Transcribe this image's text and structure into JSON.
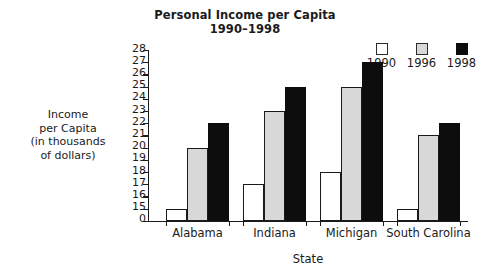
{
  "chart_data": {
    "type": "bar",
    "title": "Personal Income per Capita",
    "subtitle": "1990–1998",
    "xlabel": "State",
    "ylabel_lines": [
      "Income",
      "per Capita",
      "(in thousands",
      "of dollars)"
    ],
    "ylabel": "Income per Capita (in thousands of dollars)",
    "categories": [
      "Alabama",
      "Indiana",
      "Michigan",
      "South Carolina"
    ],
    "series": [
      {
        "name": "1990",
        "color": "#ffffff",
        "values": [
          15,
          17,
          18,
          15
        ]
      },
      {
        "name": "1996",
        "color": "#d8d8d8",
        "values": [
          20,
          23,
          25,
          21
        ]
      },
      {
        "name": "1998",
        "color": "#0d0d0d",
        "values": [
          22,
          25,
          27,
          22
        ]
      }
    ],
    "ylim": [
      15,
      28
    ],
    "y_base_label": "0",
    "y_axis_broken": true,
    "yticks": [
      28,
      27,
      26,
      25,
      24,
      23,
      22,
      21,
      20,
      19,
      18,
      17,
      16,
      15,
      0
    ],
    "grid": false,
    "legend_position": "top-right"
  },
  "legend": {
    "items": [
      {
        "label": "1990",
        "swatch": "white-square-icon"
      },
      {
        "label": "1996",
        "swatch": "gray-square-icon"
      },
      {
        "label": "1998",
        "swatch": "black-square-icon"
      }
    ]
  }
}
